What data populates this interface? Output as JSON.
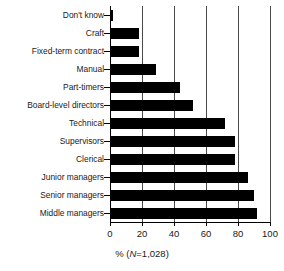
{
  "chart_data": {
    "type": "bar",
    "orientation": "horizontal",
    "title": "",
    "subtitle": "",
    "xlabel": "% (N=1,028)",
    "ylabel": "",
    "xlim": [
      0,
      100
    ],
    "xticks": [
      0,
      20,
      40,
      60,
      80,
      100
    ],
    "xticklabels": [
      "0",
      "20",
      "40",
      "60",
      "80",
      "100"
    ],
    "grid": true,
    "grid_axis": "x",
    "legend": false,
    "legend_position": "none",
    "bar_color": "#000000",
    "categories": [
      "Don't know",
      "Craft",
      "Fixed-term contract",
      "Manual",
      "Part-timers",
      "Board-level directors",
      "Technical",
      "Supervisors",
      "Clerical",
      "Junior managers",
      "Senior managers",
      "Middle managers"
    ],
    "values": [
      2,
      18,
      18,
      29,
      44,
      52,
      72,
      78,
      78,
      86,
      90,
      92
    ]
  },
  "axis": {
    "x_title_prefix": "% (",
    "x_title_italic": "N",
    "x_title_suffix": "=1,028)"
  }
}
